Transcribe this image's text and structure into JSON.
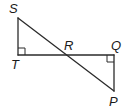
{
  "diagram": {
    "type": "geometry",
    "stroke_color": "#2b2b2b",
    "points": {
      "S": {
        "label": "S",
        "x": 18,
        "y": 18
      },
      "T": {
        "label": "T",
        "x": 18,
        "y": 55
      },
      "R": {
        "label": "R",
        "x": 66,
        "y": 55
      },
      "Q": {
        "label": "Q",
        "x": 114,
        "y": 55
      },
      "P": {
        "label": "P",
        "x": 114,
        "y": 91
      }
    },
    "segments": [
      {
        "from": "S",
        "to": "T"
      },
      {
        "from": "T",
        "to": "Q"
      },
      {
        "from": "Q",
        "to": "P"
      },
      {
        "from": "S",
        "to": "P"
      }
    ],
    "right_angles": [
      {
        "vertex": "T",
        "label": "angle STR"
      },
      {
        "vertex": "Q",
        "label": "angle PQR"
      }
    ],
    "labels": {
      "S": "S",
      "T": "T",
      "R": "R",
      "Q": "Q",
      "P": "P"
    }
  }
}
